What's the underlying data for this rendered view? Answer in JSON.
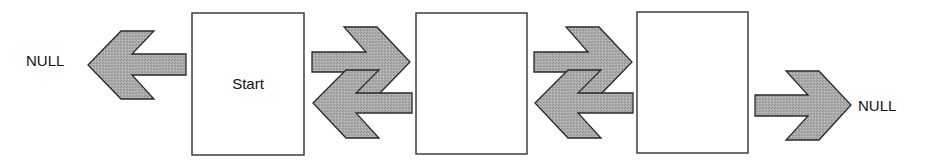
{
  "diagram": {
    "type": "doubly-linked-list",
    "colors": {
      "arrow_fill": "#a9a9a9",
      "arrow_stroke": "#2a2a2a",
      "box_stroke": "#333333",
      "box_fill": "#ffffff",
      "text": "#111111"
    },
    "null_left": {
      "label": "NULL"
    },
    "null_right": {
      "label": "NULL"
    },
    "nodes": [
      {
        "label": "Start"
      },
      {
        "label": ""
      },
      {
        "label": ""
      }
    ],
    "arrows": [
      {
        "from": "node-0",
        "to": "null-left",
        "direction": "left"
      },
      {
        "from": "node-0",
        "to": "node-1",
        "direction": "right"
      },
      {
        "from": "node-1",
        "to": "node-0",
        "direction": "left"
      },
      {
        "from": "node-1",
        "to": "node-2",
        "direction": "right"
      },
      {
        "from": "node-2",
        "to": "node-1",
        "direction": "left"
      },
      {
        "from": "node-2",
        "to": "null-right",
        "direction": "right"
      }
    ]
  }
}
